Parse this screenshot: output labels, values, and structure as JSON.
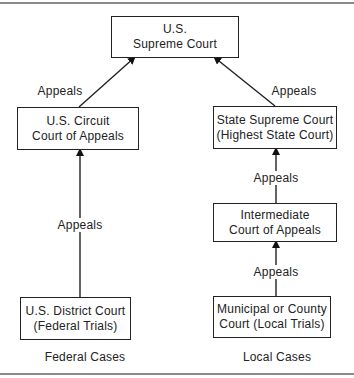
{
  "diagram": {
    "nodes": {
      "supreme": {
        "line1": "U.S.",
        "line2": "Supreme Court"
      },
      "circuit": {
        "line1": "U.S. Circuit",
        "line2": "Court of Appeals"
      },
      "state_supreme": {
        "line1": "State Supreme Court",
        "line2": "(Highest State Court)"
      },
      "intermediate": {
        "line1": "Intermediate",
        "line2": "Court of Appeals"
      },
      "district": {
        "line1": "U.S. District Court",
        "line2": "(Federal Trials)"
      },
      "municipal": {
        "line1": "Municipal or County",
        "line2": "Court (Local Trials)"
      }
    },
    "edges": [
      {
        "from": "circuit",
        "to": "supreme",
        "label": "Appeals"
      },
      {
        "from": "state_supreme",
        "to": "supreme",
        "label": "Appeals"
      },
      {
        "from": "district",
        "to": "circuit",
        "label": "Appeals"
      },
      {
        "from": "intermediate",
        "to": "state_supreme",
        "label": "Appeals"
      },
      {
        "from": "municipal",
        "to": "intermediate",
        "label": "Appeals"
      }
    ],
    "captions": {
      "federal": "Federal Cases",
      "local": "Local Cases"
    }
  }
}
